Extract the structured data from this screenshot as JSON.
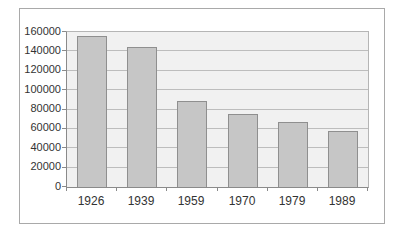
{
  "chart_data": {
    "type": "bar",
    "title": "",
    "xlabel": "",
    "ylabel": "",
    "categories": [
      "1926",
      "1939",
      "1959",
      "1970",
      "1979",
      "1989"
    ],
    "values": [
      156000,
      144000,
      89000,
      75000,
      67000,
      58000
    ],
    "ylim": [
      0,
      160000
    ],
    "ytick_step": 20000,
    "ytick_labels": [
      "0",
      "20000",
      "40000",
      "60000",
      "80000",
      "100000",
      "120000",
      "140000",
      "160000"
    ],
    "grid": true,
    "legend": "none",
    "colors": {
      "page_bg": "#ffffff",
      "chart_border": "#a9a9a9",
      "plot_bg": "#f1f1f1",
      "gridline": "#bdbdbd",
      "bar_fill": "#c6c6c6",
      "bar_border": "#8f8f8f",
      "axis": "#8a8a8a",
      "text": "#333333"
    }
  }
}
